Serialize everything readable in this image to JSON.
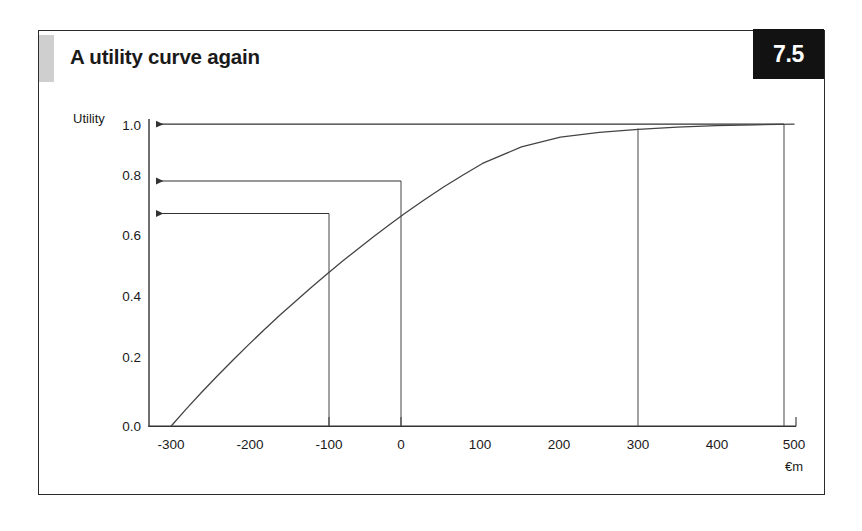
{
  "figure": {
    "title": "A utility curve again",
    "number": "7.5",
    "accent_color": "#cfcfcf",
    "badge_bg": "#121212",
    "badge_fg": "#ffffff",
    "frame_color": "#2b2b2b"
  },
  "chart_data": {
    "type": "line",
    "title": "A utility curve again",
    "xlabel": "€m",
    "ylabel": "Utility",
    "xlim": [
      -330,
      520
    ],
    "ylim": [
      0.0,
      1.04
    ],
    "grid": false,
    "legend": null,
    "xticks": [
      -300,
      -200,
      -100,
      0,
      100,
      200,
      300,
      400,
      500
    ],
    "xtick_labels": [
      "-300",
      "-200",
      "-100",
      "0",
      "100",
      "200",
      "300",
      "400",
      "500"
    ],
    "yticks": [
      0.0,
      0.2,
      0.4,
      0.6,
      0.8,
      1.0
    ],
    "ytick_labels": [
      "0.0",
      "0.2",
      "0.4",
      "0.6",
      "0.8",
      "1.0"
    ],
    "series": [
      {
        "name": "utility curve",
        "color": "#444444",
        "x": [
          -300,
          -280,
          -260,
          -240,
          -220,
          -200,
          -180,
          -160,
          -140,
          -120,
          -100,
          -80,
          -60,
          -40,
          -20,
          0,
          25,
          50,
          75,
          100,
          150,
          200,
          250,
          300,
          350,
          400,
          450,
          500
        ],
        "y": [
          0.0,
          0.058,
          0.114,
          0.168,
          0.22,
          0.271,
          0.32,
          0.368,
          0.414,
          0.459,
          0.503,
          0.546,
          0.587,
          0.627,
          0.666,
          0.704,
          0.749,
          0.792,
          0.832,
          0.87,
          0.925,
          0.957,
          0.973,
          0.983,
          0.99,
          0.995,
          0.998,
          1.0
        ]
      }
    ],
    "annotations": [
      {
        "name": "drop-line-minus-100",
        "x": -100,
        "y": 0.704,
        "type": "vertical-drop-to-axis"
      },
      {
        "name": "drop-line-0",
        "x": 0,
        "y": 0.81,
        "type": "vertical-drop-to-axis"
      },
      {
        "name": "drop-line-300",
        "x": 300,
        "y": 0.983,
        "type": "vertical-drop-to-axis"
      },
      {
        "name": "drop-line-500",
        "x": 500,
        "y": 1.0,
        "type": "vertical-drop-to-axis"
      },
      {
        "name": "arrow-to-utility-0_70",
        "from_x": -100,
        "to_x": -300,
        "y": 0.704,
        "type": "horizontal-arrow-to-y-axis"
      },
      {
        "name": "arrow-to-utility-0_81",
        "from_x": 0,
        "to_x": -300,
        "y": 0.81,
        "type": "horizontal-arrow-to-y-axis"
      },
      {
        "name": "arrow-to-utility-1_00",
        "from_x": 500,
        "to_x": -300,
        "y": 1.0,
        "type": "horizontal-arrow-to-y-axis"
      }
    ]
  }
}
